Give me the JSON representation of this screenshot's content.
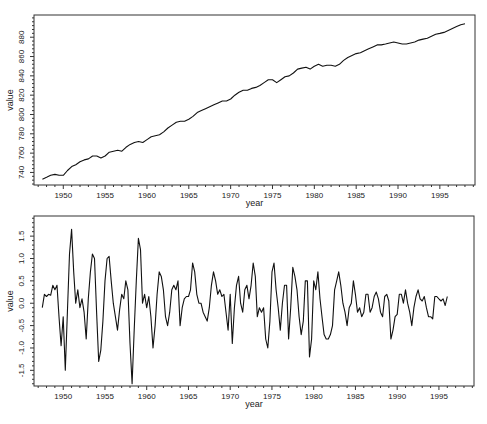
{
  "chart_data": [
    {
      "type": "line",
      "title": "",
      "xlabel": "year",
      "ylabel": "value",
      "xlim": [
        1946.5,
        1999.2
      ],
      "ylim": [
        727,
        903
      ],
      "grid": false,
      "legend": null,
      "x_ticks": [
        1950,
        1955,
        1960,
        1965,
        1970,
        1975,
        1980,
        1985,
        1990,
        1995
      ],
      "x_tick_labels": [
        "1950",
        "1955",
        "1960",
        "1965",
        "1970",
        "1975",
        "1980",
        "1985",
        "1990",
        "1995"
      ],
      "y_ticks": [
        740,
        760,
        780,
        800,
        820,
        840,
        860,
        880
      ],
      "y_tick_labels": [
        "740",
        "760",
        "780",
        "800",
        "820",
        "840",
        "860",
        "880"
      ],
      "series": [
        {
          "name": "value",
          "x": [
            1947.5,
            1948.0,
            1948.5,
            1949.0,
            1949.5,
            1950.0,
            1950.5,
            1951.0,
            1951.5,
            1952.0,
            1952.5,
            1953.0,
            1953.5,
            1954.0,
            1954.5,
            1955.0,
            1955.5,
            1956.0,
            1956.5,
            1957.0,
            1957.5,
            1958.0,
            1958.5,
            1959.0,
            1959.5,
            1960.0,
            1960.5,
            1961.0,
            1961.5,
            1962.0,
            1962.5,
            1963.0,
            1963.5,
            1964.0,
            1964.5,
            1965.0,
            1965.5,
            1966.0,
            1966.5,
            1967.0,
            1967.5,
            1968.0,
            1968.5,
            1969.0,
            1969.5,
            1970.0,
            1970.5,
            1971.0,
            1971.5,
            1972.0,
            1972.5,
            1973.0,
            1973.5,
            1974.0,
            1974.5,
            1975.0,
            1975.5,
            1976.0,
            1976.5,
            1977.0,
            1977.5,
            1978.0,
            1978.5,
            1979.0,
            1979.5,
            1980.0,
            1980.5,
            1981.0,
            1981.5,
            1982.0,
            1982.5,
            1983.0,
            1983.5,
            1984.0,
            1984.5,
            1985.0,
            1985.5,
            1986.0,
            1986.5,
            1987.0,
            1987.5,
            1988.0,
            1988.5,
            1989.0,
            1989.5,
            1990.0,
            1990.5,
            1991.0,
            1991.5,
            1992.0,
            1992.5,
            1993.0,
            1993.5,
            1994.0,
            1994.5,
            1995.0,
            1995.5,
            1996.0,
            1996.5,
            1997.0,
            1997.5,
            1998.0
          ],
          "y": [
            733,
            735,
            737,
            738,
            737,
            737,
            742,
            746,
            748,
            751,
            753,
            754,
            757,
            757,
            755,
            757,
            761,
            762,
            763,
            762,
            766,
            769,
            771,
            772,
            771,
            774,
            777,
            778,
            779,
            782,
            786,
            789,
            792,
            793,
            793,
            795,
            798,
            802,
            804,
            806,
            808,
            810,
            812,
            814,
            814,
            816,
            820,
            823,
            825,
            825,
            827,
            828,
            830,
            833,
            836,
            836,
            833,
            836,
            839,
            840,
            843,
            847,
            848,
            849,
            847,
            850,
            852,
            850,
            851,
            851,
            850,
            852,
            856,
            859,
            861,
            863,
            864,
            866,
            868,
            870,
            872,
            872,
            873,
            874,
            875,
            874,
            873,
            873,
            874,
            875,
            877,
            878,
            879,
            881,
            883,
            884,
            885,
            887,
            889,
            891,
            893,
            894
          ]
        }
      ]
    },
    {
      "type": "line",
      "title": "",
      "xlabel": "year",
      "ylabel": "value",
      "xlim": [
        1946.5,
        1999.2
      ],
      "ylim": [
        -1.85,
        1.95
      ],
      "grid": false,
      "legend": null,
      "x_ticks": [
        1950,
        1955,
        1960,
        1965,
        1970,
        1975,
        1980,
        1985,
        1990,
        1995
      ],
      "x_tick_labels": [
        "1950",
        "1955",
        "1960",
        "1965",
        "1970",
        "1975",
        "1980",
        "1985",
        "1990",
        "1995"
      ],
      "y_ticks": [
        -1.5,
        -1.0,
        -0.5,
        0.0,
        0.5,
        1.0,
        1.5
      ],
      "y_tick_labels": [
        "-1.5",
        "-1.0",
        "-0.5",
        "0.0",
        "0.5",
        "1.0",
        "1.5"
      ],
      "series": [
        {
          "name": "value",
          "x": [
            1947.5,
            1947.75,
            1948.0,
            1948.25,
            1948.5,
            1948.75,
            1949.0,
            1949.25,
            1949.5,
            1949.75,
            1950.0,
            1950.25,
            1950.5,
            1950.75,
            1951.0,
            1951.25,
            1951.5,
            1951.75,
            1952.0,
            1952.25,
            1952.5,
            1952.75,
            1953.0,
            1953.25,
            1953.5,
            1953.75,
            1954.0,
            1954.25,
            1954.5,
            1954.75,
            1955.0,
            1955.25,
            1955.5,
            1955.75,
            1956.0,
            1956.25,
            1956.5,
            1956.75,
            1957.0,
            1957.25,
            1957.5,
            1957.75,
            1958.0,
            1958.25,
            1958.5,
            1958.75,
            1959.0,
            1959.25,
            1959.5,
            1959.75,
            1960.0,
            1960.25,
            1960.5,
            1960.75,
            1961.0,
            1961.25,
            1961.5,
            1961.75,
            1962.0,
            1962.25,
            1962.5,
            1962.75,
            1963.0,
            1963.25,
            1963.5,
            1963.75,
            1964.0,
            1964.25,
            1964.5,
            1964.75,
            1965.0,
            1965.25,
            1965.5,
            1965.75,
            1966.0,
            1966.25,
            1966.5,
            1966.75,
            1967.0,
            1967.25,
            1967.5,
            1967.75,
            1968.0,
            1968.25,
            1968.5,
            1968.75,
            1969.0,
            1969.25,
            1969.5,
            1969.75,
            1970.0,
            1970.25,
            1970.5,
            1970.75,
            1971.0,
            1971.25,
            1971.5,
            1971.75,
            1972.0,
            1972.25,
            1972.5,
            1972.75,
            1973.0,
            1973.25,
            1973.5,
            1973.75,
            1974.0,
            1974.25,
            1974.5,
            1974.75,
            1975.0,
            1975.25,
            1975.5,
            1975.75,
            1976.0,
            1976.25,
            1976.5,
            1976.75,
            1977.0,
            1977.25,
            1977.5,
            1977.75,
            1978.0,
            1978.25,
            1978.5,
            1978.75,
            1979.0,
            1979.25,
            1979.5,
            1979.75,
            1980.0,
            1980.25,
            1980.5,
            1980.75,
            1981.0,
            1981.25,
            1981.5,
            1981.75,
            1982.0,
            1982.25,
            1982.5,
            1982.75,
            1983.0,
            1983.25,
            1983.5,
            1983.75,
            1984.0,
            1984.25,
            1984.5,
            1984.75,
            1985.0,
            1985.25,
            1985.5,
            1985.75,
            1986.0,
            1986.25,
            1986.5,
            1986.75,
            1987.0,
            1987.25,
            1987.5,
            1987.75,
            1988.0,
            1988.25,
            1988.5,
            1988.75,
            1989.0,
            1989.25,
            1989.5,
            1989.75,
            1990.0,
            1990.25,
            1990.5,
            1990.75,
            1991.0,
            1991.25,
            1991.5,
            1991.75,
            1992.0,
            1992.25,
            1992.5,
            1992.75,
            1993.0,
            1993.25,
            1993.5,
            1993.75,
            1994.0,
            1994.25,
            1994.5,
            1994.75,
            1995.0,
            1995.25,
            1995.5,
            1995.75,
            1996.0,
            1996.25,
            1996.5,
            1996.75,
            1997.0,
            1997.25,
            1997.5,
            1997.75,
            1998.0
          ],
          "y": [
            -0.1,
            0.2,
            0.15,
            0.2,
            0.18,
            0.4,
            0.3,
            0.4,
            -0.3,
            -0.95,
            -0.3,
            -1.5,
            -0.2,
            1.1,
            1.65,
            0.7,
            0.0,
            0.3,
            -0.1,
            0.1,
            -0.2,
            -0.8,
            0.1,
            0.7,
            1.1,
            1.0,
            -0.2,
            -1.3,
            -1.05,
            -0.4,
            0.5,
            1.0,
            1.05,
            0.5,
            0.0,
            -0.3,
            -0.6,
            -0.15,
            0.2,
            0.1,
            0.5,
            0.3,
            -0.9,
            -1.8,
            -0.6,
            0.5,
            1.45,
            1.2,
            0.0,
            0.2,
            -0.1,
            0.15,
            -0.3,
            -1.0,
            -0.5,
            0.2,
            0.7,
            0.6,
            0.3,
            -0.3,
            -0.5,
            -0.2,
            0.3,
            0.4,
            0.3,
            0.5,
            -0.5,
            -0.1,
            0.1,
            0.15,
            0.15,
            0.3,
            0.9,
            0.7,
            0.2,
            0.0,
            0.0,
            -0.2,
            -0.3,
            -0.4,
            -0.1,
            0.4,
            0.7,
            0.5,
            0.2,
            0.3,
            0.15,
            0.2,
            -0.2,
            -0.6,
            0.2,
            -0.9,
            -0.1,
            0.4,
            0.6,
            0.0,
            -0.2,
            0.3,
            0.4,
            0.1,
            0.4,
            0.9,
            0.6,
            -0.3,
            -0.1,
            -0.2,
            -0.1,
            -0.8,
            -1.0,
            -0.4,
            0.7,
            0.9,
            0.3,
            -0.1,
            -0.6,
            0.0,
            0.4,
            0.4,
            -0.8,
            -0.1,
            0.8,
            0.6,
            0.3,
            -0.3,
            -0.7,
            -0.4,
            0.5,
            0.5,
            -1.2,
            -0.8,
            0.5,
            0.3,
            0.7,
            0.1,
            -0.3,
            -0.7,
            -0.8,
            -0.8,
            -0.7,
            -0.5,
            0.3,
            0.5,
            0.7,
            0.4,
            0.0,
            -0.2,
            -0.5,
            -0.1,
            0.0,
            0.5,
            0.2,
            -0.2,
            -0.1,
            -0.3,
            -0.2,
            0.2,
            0.2,
            -0.2,
            -0.1,
            0.15,
            0.25,
            0.1,
            -0.2,
            -0.3,
            0.15,
            0.2,
            0.05,
            -0.8,
            -0.6,
            -0.3,
            -0.25,
            0.2,
            0.2,
            0.0,
            0.3,
            0.0,
            -0.2,
            -0.5,
            -0.1,
            0.15,
            0.3,
            0.1,
            0.05,
            0.15,
            -0.1,
            -0.3,
            -0.3,
            -0.35,
            0.15,
            0.15,
            0.1,
            0.05,
            0.1,
            -0.05,
            0.15
          ]
        }
      ]
    }
  ]
}
